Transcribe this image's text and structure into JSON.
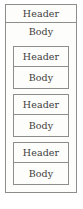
{
  "diagram": {
    "type": "nested-box-diagram",
    "canvas": {
      "width": 83,
      "height": 209,
      "background": "#ffffff"
    },
    "colors": {
      "border": "#8d8d8a",
      "fill": "#fdfdfb",
      "text": "#3c3c3a"
    },
    "outer": {
      "header": {
        "label": "Header"
      },
      "body": {
        "label": "Body",
        "blocks": [
          {
            "header": {
              "label": "Header"
            },
            "body": {
              "label": "Body"
            }
          },
          {
            "header": {
              "label": "Header"
            },
            "body": {
              "label": "Body"
            }
          },
          {
            "header": {
              "label": "Header"
            },
            "body": {
              "label": "Body"
            }
          }
        ]
      }
    }
  }
}
